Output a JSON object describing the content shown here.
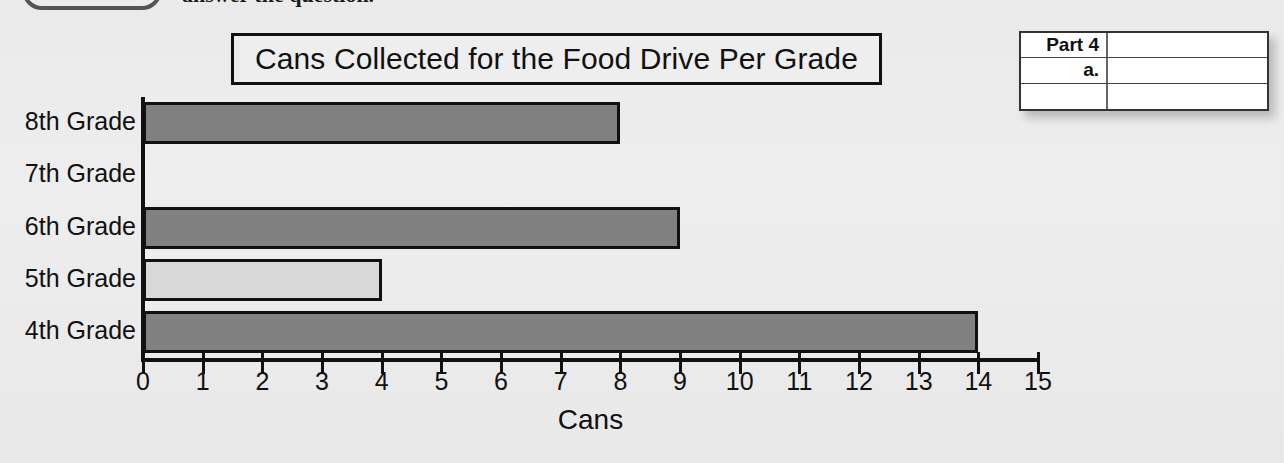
{
  "header": {
    "instruction_text": "answer the question.",
    "callout_icon": "rounded-pill-badge"
  },
  "chart_data": {
    "type": "bar",
    "orientation": "horizontal",
    "title": "Cans Collected for the Food Drive Per Grade",
    "xlabel": "Cans",
    "ylabel": "",
    "categories": [
      "8th Grade",
      "7th Grade",
      "6th Grade",
      "5th Grade",
      "4th Grade"
    ],
    "values": [
      8,
      0,
      9,
      4,
      14
    ],
    "bar_colors": [
      "#808080",
      "#808080",
      "#808080",
      "#d8d8d8",
      "#808080"
    ],
    "xlim": [
      0,
      15
    ],
    "xticks": [
      0,
      1,
      2,
      3,
      4,
      5,
      6,
      7,
      8,
      9,
      10,
      11,
      12,
      13,
      14,
      15
    ],
    "xtick_labels": [
      "0",
      "1",
      "2",
      "3",
      "4",
      "5",
      "6",
      "7",
      "8",
      "9",
      "10",
      "11",
      "12",
      "13",
      "14",
      "15"
    ],
    "grid": false,
    "legend": false,
    "bar_outline_color": "#111111",
    "axis_color": "#111111"
  },
  "part_box": {
    "rows": [
      {
        "key": "Part 4",
        "value": ""
      },
      {
        "key": "a.",
        "value": ""
      },
      {
        "key": "",
        "value": ""
      }
    ]
  }
}
